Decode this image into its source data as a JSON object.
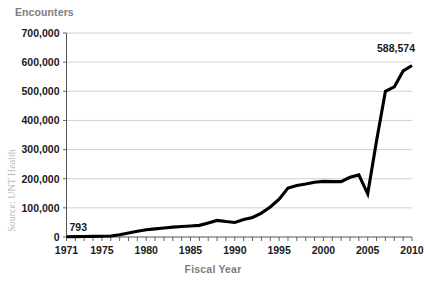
{
  "chart_data": {
    "type": "line",
    "title": "Encounters",
    "xlabel": "Fiscal Year",
    "ylabel": "Encounters",
    "source": "Source: UNT Health",
    "grid": true,
    "legend": "none",
    "xlim": [
      1971,
      2010
    ],
    "ylim": [
      0,
      700000
    ],
    "ytick_labels": [
      "700,000",
      "600,000",
      "500,000",
      "400,000",
      "300,000",
      "200,000",
      "100,000",
      "0"
    ],
    "ytick_values": [
      700000,
      600000,
      500000,
      400000,
      300000,
      200000,
      100000,
      0
    ],
    "xtick_labels": [
      "1971",
      "1975",
      "1980",
      "1985",
      "1990",
      "1995",
      "2000",
      "2005",
      "2010"
    ],
    "xtick_values": [
      1971,
      1975,
      1980,
      1985,
      1990,
      1995,
      2000,
      2005,
      2010
    ],
    "x": [
      1971,
      1972,
      1973,
      1974,
      1975,
      1976,
      1977,
      1978,
      1979,
      1980,
      1981,
      1982,
      1983,
      1984,
      1985,
      1986,
      1987,
      1988,
      1989,
      1990,
      1991,
      1992,
      1993,
      1994,
      1995,
      1996,
      1997,
      1998,
      1999,
      2000,
      2001,
      2002,
      2003,
      2004,
      2005,
      2006,
      2007,
      2008,
      2009,
      2010
    ],
    "values": [
      793,
      1200,
      1600,
      2000,
      2500,
      3500,
      8000,
      14000,
      20000,
      25000,
      28000,
      31000,
      34000,
      36000,
      38000,
      40000,
      48000,
      57000,
      53000,
      50000,
      60000,
      67000,
      82000,
      103000,
      130000,
      168000,
      177000,
      182000,
      188000,
      191000,
      190000,
      190000,
      205000,
      213000,
      148000,
      330000,
      500000,
      515000,
      570000,
      588574
    ],
    "annotations": [
      {
        "label": "793",
        "x": 1971,
        "y": 793
      },
      {
        "label": "588,574",
        "x": 2010,
        "y": 588574
      }
    ]
  }
}
